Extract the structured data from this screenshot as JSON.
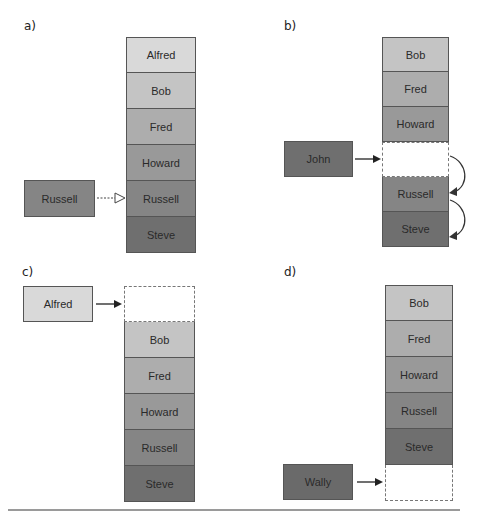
{
  "colors": {
    "Alfred": "#d9d9d9",
    "Bob": "#c4c4c4",
    "Fred": "#adadad",
    "Howard": "#999999",
    "Russell": "#858585",
    "Steve": "#6f6f6f",
    "John": "#6f6f6f",
    "Wally": "#6a6a6a",
    "empty": "#ffffff"
  },
  "panels": {
    "a": {
      "label": "a)",
      "stack": [
        "Alfred",
        "Bob",
        "Fred",
        "Howard",
        "Russell",
        "Steve"
      ],
      "incoming": "Russell",
      "arrow_style": "dotted-hollow",
      "description": "Lookup: item compared against matching position"
    },
    "b": {
      "label": "b)",
      "stack": [
        "Bob",
        "Fred",
        "Howard",
        "",
        "Russell",
        "Steve"
      ],
      "incoming": "John",
      "arrow_style": "solid",
      "shift_arrows": 2,
      "description": "Insert in middle: later items shift down"
    },
    "c": {
      "label": "c)",
      "stack": [
        "",
        "Bob",
        "Fred",
        "Howard",
        "Russell",
        "Steve"
      ],
      "incoming": "Alfred",
      "arrow_style": "solid",
      "description": "Insert at front"
    },
    "d": {
      "label": "d)",
      "stack": [
        "Bob",
        "Fred",
        "Howard",
        "Russell",
        "Steve",
        ""
      ],
      "incoming": "Wally",
      "arrow_style": "solid",
      "description": "Append at end"
    }
  }
}
